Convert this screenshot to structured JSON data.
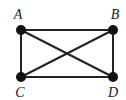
{
  "diagram": {
    "type": "graph",
    "colors": {
      "edge": "#222222",
      "node": "#111111",
      "label": "#1a1a1a",
      "background": "#ffffff"
    },
    "nodes": [
      {
        "id": "A",
        "label": "A",
        "x": 21,
        "y": 30,
        "lx": 18,
        "ly": 19
      },
      {
        "id": "B",
        "label": "B",
        "x": 113,
        "y": 30,
        "lx": 115,
        "ly": 19
      },
      {
        "id": "C",
        "label": "C",
        "x": 21,
        "y": 77,
        "lx": 20,
        "ly": 97
      },
      {
        "id": "D",
        "label": "D",
        "x": 113,
        "y": 77,
        "lx": 113,
        "ly": 97
      }
    ],
    "edges": [
      {
        "from": "A",
        "to": "B"
      },
      {
        "from": "C",
        "to": "D"
      },
      {
        "from": "A",
        "to": "C"
      },
      {
        "from": "B",
        "to": "D"
      },
      {
        "from": "A",
        "to": "D"
      },
      {
        "from": "B",
        "to": "C"
      }
    ]
  }
}
